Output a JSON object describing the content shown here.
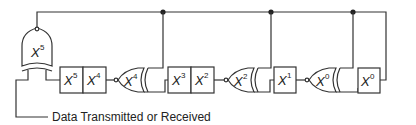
{
  "diagram": {
    "type": "LFSR / CRC shift register circuit",
    "caption": "Data Transmitted or Received",
    "feedback_gate": {
      "label": "X",
      "exp": "5"
    },
    "registers": [
      {
        "id": "r5",
        "label": "X",
        "exp": "5"
      },
      {
        "id": "r4",
        "label": "X",
        "exp": "4"
      },
      {
        "id": "r3",
        "label": "X",
        "exp": "3"
      },
      {
        "id": "r2",
        "label": "X",
        "exp": "2"
      },
      {
        "id": "r1",
        "label": "X",
        "exp": "1"
      },
      {
        "id": "r0",
        "label": "X",
        "exp": "0"
      }
    ],
    "xor_gates": [
      {
        "id": "g4",
        "label": "X",
        "exp": "4"
      },
      {
        "id": "g2",
        "label": "X",
        "exp": "2"
      },
      {
        "id": "g0",
        "label": "X",
        "exp": "0"
      }
    ],
    "colors": {
      "line": "#333333",
      "background": "#ffffff"
    }
  }
}
